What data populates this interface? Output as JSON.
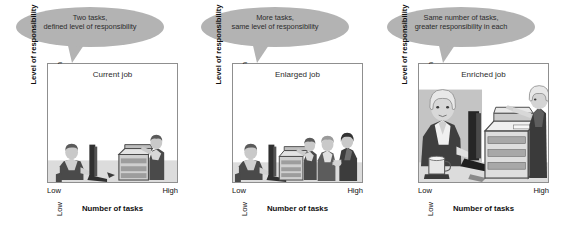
{
  "figure": {
    "type": "diagram",
    "axis": {
      "x_title": "Number of tasks",
      "y_title": "Level of responsibility",
      "x_low": "Low",
      "x_high": "High",
      "y_low": "Low",
      "y_high": "High"
    },
    "colors": {
      "callout_fill": "#b3b3b3",
      "frame_line": "#8f8f8f",
      "text": "#111111",
      "art_dark": "#3a3a3a",
      "art_mid": "#8a8a8a",
      "art_light": "#d6d6d6"
    }
  },
  "panels": [
    {
      "id": "current-job",
      "title": "Current job",
      "callout": {
        "line1": "Two tasks,",
        "line2": "defined level of responsibility"
      },
      "axis": {
        "x_title": "Number of tasks",
        "y_title": "Level of responsibility",
        "x_low": "Low",
        "x_high": "High",
        "y_low": "Low",
        "y_high": "High"
      },
      "scene": {
        "figure_count": 2,
        "description": "One person seated at a computer and one person at a copier"
      }
    },
    {
      "id": "enlarged-job",
      "title": "Enlarged job",
      "callout": {
        "line1": "More tasks,",
        "line2": "same level of responsibility"
      },
      "axis": {
        "x_title": "Number of tasks",
        "y_title": "Level of responsibility",
        "x_low": "Low",
        "x_high": "High",
        "y_low": "Low",
        "y_high": "High"
      },
      "scene": {
        "figure_count": 4,
        "description": "Person at a computer, person at a copier, and two people shaking hands"
      }
    },
    {
      "id": "enriched-job",
      "title": "Enriched job",
      "callout": {
        "line1": "Same number of tasks,",
        "line2": "greater responsibility in each"
      },
      "axis": {
        "x_title": "Number of tasks",
        "y_title": "Level of responsibility",
        "x_low": "Low",
        "x_high": "High",
        "y_low": "Low",
        "y_high": "High"
      },
      "scene": {
        "figure_count": 2,
        "description": "Large figure at a computer with a coffee mug and a large figure at a copier"
      }
    }
  ]
}
